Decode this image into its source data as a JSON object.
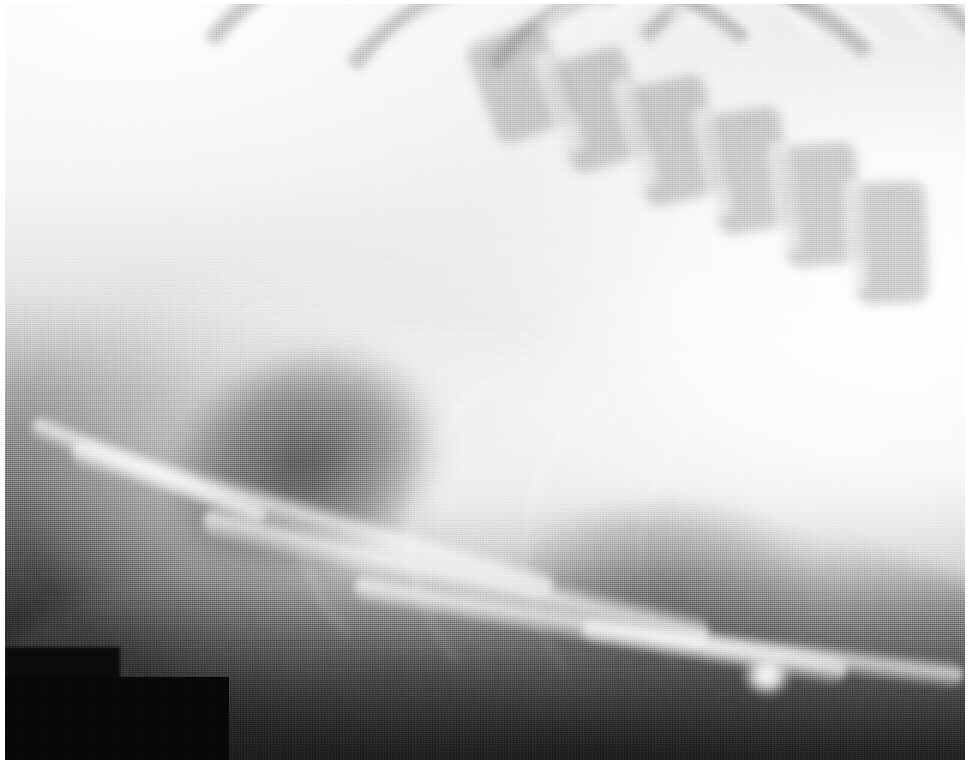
{
  "image": {
    "kind": "radiograph",
    "modality": "X-ray",
    "view": "lateral thorax",
    "caption": "",
    "width": 972,
    "height": 769,
    "colorspace": "grayscale",
    "border_color": "#ffffff",
    "background_color": "#b9b9b9"
  },
  "tones": {
    "brightest": "#ffffff",
    "bright_soft_tissue": "#efefef",
    "mid_gray": "#b5b5b5",
    "dark_gray": "#5a5a5a",
    "near_black": "#141414",
    "redaction_black": "#070707"
  },
  "regions": {
    "upper_left_field": "bright lung field with faint rib shadows",
    "upper_right_ribs": "stacked rib heads and vertebral bodies",
    "center": "cardiac silhouette",
    "lower_left": "sternum and costal cartilage bands over dark gas",
    "lower_right": "focal bright opacity / nodule",
    "bottom_left_block": "blacked-out label area"
  },
  "anatomy": {
    "ribs": [
      {
        "id": "rib-1",
        "left": 11,
        "top": -12,
        "width": 58,
        "height": 72,
        "rotate": -6,
        "thickness": 9,
        "tone": "bright"
      },
      {
        "id": "rib-2",
        "left": 17,
        "top": -9,
        "width": 58,
        "height": 72,
        "rotate": -5,
        "thickness": 8,
        "tone": "bright"
      },
      {
        "id": "rib-3",
        "left": 24,
        "top": -7,
        "width": 57,
        "height": 74,
        "rotate": -4,
        "thickness": 8,
        "tone": "bright"
      },
      {
        "id": "rib-4",
        "left": 31,
        "top": -6,
        "width": 56,
        "height": 76,
        "rotate": -3,
        "thickness": 8,
        "tone": "bright"
      },
      {
        "id": "rib-5",
        "left": 38,
        "top": -6,
        "width": 55,
        "height": 78,
        "rotate": -2,
        "thickness": 8,
        "tone": "bright"
      },
      {
        "id": "rib-6",
        "left": 45,
        "top": -6,
        "width": 54,
        "height": 80,
        "rotate": -1,
        "thickness": 8,
        "tone": "bright"
      },
      {
        "id": "rib-7",
        "left": 52,
        "top": -7,
        "width": 52,
        "height": 82,
        "rotate": 1,
        "thickness": 8,
        "tone": "bright"
      },
      {
        "id": "rib-8",
        "left": 59,
        "top": -8,
        "width": 50,
        "height": 84,
        "rotate": 3,
        "thickness": 8,
        "tone": "bright"
      },
      {
        "id": "rib-9",
        "left": 66,
        "top": -9,
        "width": 47,
        "height": 86,
        "rotate": 5,
        "thickness": 7,
        "tone": "bright"
      }
    ],
    "rib_shadows": [
      {
        "id": "rib-shadow-1",
        "left": 14,
        "top": -10,
        "width": 58,
        "height": 72,
        "rotate": -6,
        "thickness": 16
      },
      {
        "id": "rib-shadow-2",
        "left": 28,
        "top": -6,
        "width": 57,
        "height": 76,
        "rotate": -4,
        "thickness": 16
      },
      {
        "id": "rib-shadow-3",
        "left": 42,
        "top": -5,
        "width": 55,
        "height": 80,
        "rotate": -2,
        "thickness": 16
      },
      {
        "id": "rib-shadow-4",
        "left": 56,
        "top": -7,
        "width": 52,
        "height": 84,
        "rotate": 2,
        "thickness": 16
      },
      {
        "id": "rib-shadow-5",
        "left": 70,
        "top": -10,
        "width": 46,
        "height": 88,
        "rotate": 6,
        "thickness": 15
      }
    ],
    "vertebrae": [
      {
        "id": "vertebra-1",
        "left": 49.5,
        "top": 3.5,
        "width": 8.5,
        "height": 14,
        "rotate": -21
      },
      {
        "id": "vertebra-2",
        "left": 57.5,
        "top": 6.5,
        "width": 8.5,
        "height": 15,
        "rotate": -17
      },
      {
        "id": "vertebra-3",
        "left": 65.5,
        "top": 10.0,
        "width": 8.5,
        "height": 16,
        "rotate": -13
      },
      {
        "id": "vertebra-4",
        "left": 73.5,
        "top": 14.0,
        "width": 8.0,
        "height": 16,
        "rotate": -9
      },
      {
        "id": "vertebra-5",
        "left": 81.0,
        "top": 18.5,
        "width": 8.0,
        "height": 16,
        "rotate": -5
      },
      {
        "id": "vertebra-6",
        "left": 88.5,
        "top": 23.5,
        "width": 7.5,
        "height": 16,
        "rotate": -2
      }
    ],
    "disc_spaces": [
      {
        "id": "disc-1",
        "left": 56.5,
        "top": 6.0,
        "width": 2.4,
        "height": 14,
        "rotate": -19
      },
      {
        "id": "disc-2",
        "left": 64.5,
        "top": 9.5,
        "width": 2.4,
        "height": 15,
        "rotate": -15
      },
      {
        "id": "disc-3",
        "left": 72.5,
        "top": 13.5,
        "width": 2.4,
        "height": 15,
        "rotate": -11
      },
      {
        "id": "disc-4",
        "left": 80.0,
        "top": 18.0,
        "width": 2.4,
        "height": 15,
        "rotate": -7
      },
      {
        "id": "disc-5",
        "left": 87.5,
        "top": 23.0,
        "width": 2.2,
        "height": 15,
        "rotate": -3
      }
    ],
    "sternal_bands": [
      {
        "id": "sternal-band-1",
        "left": 6,
        "top": 66.0,
        "width": 52,
        "height": 4.0,
        "rotate": 16
      },
      {
        "id": "sternal-band-2",
        "left": 20,
        "top": 73.5,
        "width": 54,
        "height": 4.4,
        "rotate": 13
      },
      {
        "id": "sternal-band-3",
        "left": 36,
        "top": 80.5,
        "width": 52,
        "height": 4.0,
        "rotate": 10
      },
      {
        "id": "sternal-band-4",
        "left": 2,
        "top": 60.0,
        "width": 26,
        "height": 3.2,
        "rotate": 22
      },
      {
        "id": "sternal-band-5",
        "left": 60,
        "top": 84.0,
        "width": 40,
        "height": 3.4,
        "rotate": 7
      }
    ],
    "costal_arcs": [
      {
        "id": "costal-arc-1",
        "left": 30,
        "top": 40,
        "width": 46,
        "height": 52,
        "rotate": 4,
        "thickness": 6
      },
      {
        "id": "costal-arc-2",
        "left": 42,
        "top": 44,
        "width": 44,
        "height": 52,
        "rotate": 6,
        "thickness": 6
      },
      {
        "id": "costal-arc-3",
        "left": 54,
        "top": 46,
        "width": 42,
        "height": 52,
        "rotate": 8,
        "thickness": 5
      },
      {
        "id": "costal-arc-4",
        "left": 66,
        "top": 46,
        "width": 40,
        "height": 52,
        "rotate": 10,
        "thickness": 5
      }
    ],
    "nodule": {
      "id": "nodule-opacity",
      "left": 76.5,
      "top": 86.0,
      "width": 6.0,
      "height": 6.5
    }
  },
  "redaction": {
    "block": {
      "left": 0.0,
      "top": 89.0,
      "width": 23.3,
      "height": 11.0
    },
    "block_upper": {
      "left": 0.0,
      "top": 85.0,
      "width": 12.0,
      "height": 6.0
    }
  }
}
